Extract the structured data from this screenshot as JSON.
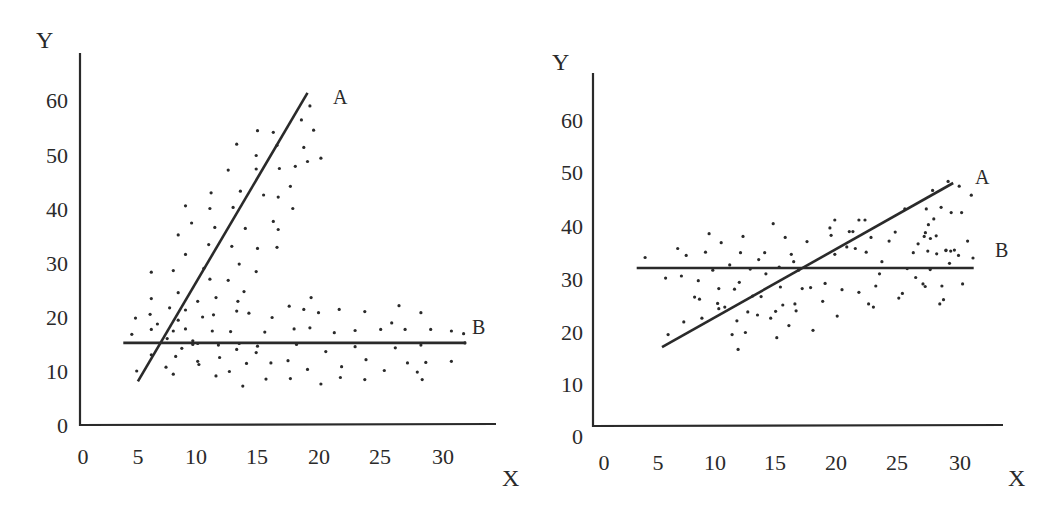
{
  "chart_data": [
    {
      "type": "scatter",
      "title": "",
      "xlabel": "X",
      "ylabel": "Y",
      "xlim": [
        0,
        34
      ],
      "ylim": [
        0,
        68
      ],
      "x_ticks": [
        "0",
        "5",
        "10",
        "15",
        "20",
        "25",
        "30"
      ],
      "y_ticks": [
        "0",
        "10",
        "20",
        "30",
        "40",
        "50",
        "60"
      ],
      "grid": false,
      "legend": "none",
      "lines": [
        {
          "name": "A",
          "x": [
            4.5,
            18.4
          ],
          "y": [
            8.1,
            61.5
          ]
        },
        {
          "name": "B",
          "x": [
            3.3,
            31.4
          ],
          "y": [
            15.2,
            15.2
          ]
        }
      ],
      "series": [
        {
          "name": "upper cluster",
          "points": [
            [
              18.6,
              59.1
            ],
            [
              17.9,
              56.5
            ],
            [
              18.9,
              54.6
            ],
            [
              15.6,
              54.2
            ],
            [
              15.9,
              51.8
            ],
            [
              14.3,
              54.5
            ],
            [
              12.6,
              52.0
            ],
            [
              14.2,
              49.9
            ],
            [
              18.1,
              51.4
            ],
            [
              19.5,
              49.4
            ],
            [
              17.4,
              47.9
            ],
            [
              18.4,
              48.8
            ],
            [
              16.1,
              47.5
            ],
            [
              14.2,
              47.4
            ],
            [
              11.9,
              47.2
            ],
            [
              14.8,
              42.6
            ],
            [
              12.9,
              43.3
            ],
            [
              16.0,
              42.2
            ],
            [
              17.0,
              44.2
            ],
            [
              10.5,
              43.0
            ],
            [
              8.4,
              40.6
            ],
            [
              10.4,
              40.1
            ],
            [
              12.3,
              40.3
            ],
            [
              17.2,
              40.1
            ],
            [
              8.9,
              37.4
            ],
            [
              10.8,
              36.6
            ],
            [
              13.3,
              36.4
            ],
            [
              15.6,
              37.7
            ],
            [
              16.0,
              36.2
            ],
            [
              7.8,
              35.2
            ],
            [
              10.3,
              33.4
            ],
            [
              12.2,
              33.1
            ],
            [
              14.3,
              32.7
            ],
            [
              15.9,
              32.9
            ],
            [
              8.4,
              31.6
            ],
            [
              9.9,
              29.0
            ],
            [
              12.8,
              29.8
            ],
            [
              14.2,
              28.4
            ],
            [
              5.6,
              28.3
            ],
            [
              7.4,
              28.6
            ],
            [
              10.4,
              27.0
            ],
            [
              11.9,
              26.8
            ],
            [
              7.8,
              24.5
            ],
            [
              13.2,
              24.7
            ],
            [
              5.6,
              23.4
            ],
            [
              10.9,
              23.6
            ],
            [
              12.7,
              22.9
            ],
            [
              9.4,
              22.9
            ],
            [
              8.4,
              21.3
            ],
            [
              13.6,
              20.7
            ],
            [
              12.6,
              21.1
            ],
            [
              10.7,
              20.4
            ],
            [
              9.8,
              20.0
            ]
          ]
        },
        {
          "name": "lower cluster",
          "points": [
            [
              4.3,
              19.8
            ],
            [
              5.5,
              20.5
            ],
            [
              6.1,
              18.7
            ],
            [
              5.6,
              17.7
            ],
            [
              7.4,
              17.4
            ],
            [
              7.8,
              19.4
            ],
            [
              8.4,
              17.8
            ],
            [
              7.1,
              21.7
            ],
            [
              4.0,
              16.8
            ],
            [
              6.9,
              16.0
            ],
            [
              9.0,
              15.6
            ],
            [
              9.4,
              15.1
            ],
            [
              10.6,
              17.4
            ],
            [
              11.1,
              14.8
            ],
            [
              12.1,
              17.3
            ],
            [
              14.3,
              14.6
            ],
            [
              14.9,
              17.2
            ],
            [
              15.5,
              19.9
            ],
            [
              16.9,
              22.0
            ],
            [
              17.3,
              17.8
            ],
            [
              18.1,
              21.4
            ],
            [
              18.7,
              23.6
            ],
            [
              18.6,
              18.0
            ],
            [
              19.3,
              20.8
            ],
            [
              20.6,
              17.1
            ],
            [
              21.0,
              21.4
            ],
            [
              22.3,
              17.5
            ],
            [
              23.1,
              21.0
            ],
            [
              24.4,
              17.7
            ],
            [
              25.3,
              18.9
            ],
            [
              25.9,
              22.1
            ],
            [
              26.4,
              17.7
            ],
            [
              27.7,
              20.8
            ],
            [
              28.5,
              17.7
            ],
            [
              30.2,
              17.4
            ],
            [
              31.2,
              16.9
            ],
            [
              31.3,
              15.2
            ],
            [
              4.4,
              10.0
            ],
            [
              5.6,
              13.0
            ],
            [
              6.8,
              10.7
            ],
            [
              7.4,
              9.4
            ],
            [
              7.6,
              12.7
            ],
            [
              8.1,
              14.2
            ],
            [
              9.0,
              14.9
            ],
            [
              9.4,
              11.8
            ],
            [
              9.5,
              11.2
            ],
            [
              10.9,
              9.1
            ],
            [
              11.2,
              12.5
            ],
            [
              12.0,
              9.9
            ],
            [
              12.6,
              14.0
            ],
            [
              13.4,
              11.4
            ],
            [
              14.2,
              13.4
            ],
            [
              15.0,
              8.5
            ],
            [
              15.4,
              11.5
            ],
            [
              16.8,
              11.9
            ],
            [
              17.0,
              8.6
            ],
            [
              17.5,
              14.9
            ],
            [
              18.4,
              10.3
            ],
            [
              19.5,
              7.6
            ],
            [
              19.9,
              13.6
            ],
            [
              21.1,
              8.8
            ],
            [
              21.2,
              10.8
            ],
            [
              22.3,
              14.5
            ],
            [
              23.2,
              12.1
            ],
            [
              23.1,
              8.4
            ],
            [
              24.7,
              10.1
            ],
            [
              25.6,
              14.3
            ],
            [
              26.6,
              11.5
            ],
            [
              27.4,
              9.8
            ],
            [
              27.7,
              14.8
            ],
            [
              27.8,
              8.4
            ],
            [
              28.1,
              11.6
            ],
            [
              30.2,
              11.8
            ],
            [
              13.1,
              7.2
            ],
            [
              12.8,
              15.1
            ]
          ]
        }
      ],
      "annotations": [
        {
          "text": "A",
          "near": "line A top end"
        },
        {
          "text": "B",
          "near": "line B right end"
        }
      ]
    },
    {
      "type": "scatter",
      "title": "",
      "xlabel": "X",
      "ylabel": "Y",
      "xlim": [
        0,
        34
      ],
      "ylim": [
        0,
        67
      ],
      "x_ticks": [
        "0",
        "5",
        "10",
        "15",
        "20",
        "25",
        "30"
      ],
      "y_ticks": [
        "0",
        "10",
        "20",
        "30",
        "40",
        "50",
        "60"
      ],
      "grid": false,
      "legend": "none",
      "lines": [
        {
          "name": "A",
          "x": [
            5.3,
            29.4
          ],
          "y": [
            17.0,
            48.1
          ]
        },
        {
          "name": "B",
          "x": [
            3.2,
            31.1
          ],
          "y": [
            32.0,
            32.0
          ]
        }
      ],
      "series": [
        {
          "name": "points",
          "points": [
            [
              3.9,
              34.0
            ],
            [
              5.6,
              30.1
            ],
            [
              5.8,
              19.4
            ],
            [
              6.6,
              35.7
            ],
            [
              6.9,
              30.5
            ],
            [
              7.1,
              21.8
            ],
            [
              7.3,
              34.4
            ],
            [
              8.0,
              26.5
            ],
            [
              8.3,
              29.6
            ],
            [
              8.4,
              26.1
            ],
            [
              8.6,
              22.5
            ],
            [
              8.9,
              35.0
            ],
            [
              9.2,
              38.5
            ],
            [
              9.5,
              31.6
            ],
            [
              9.9,
              25.3
            ],
            [
              10.0,
              28.1
            ],
            [
              10.0,
              24.3
            ],
            [
              10.2,
              36.8
            ],
            [
              10.5,
              24.6
            ],
            [
              10.9,
              32.6
            ],
            [
              11.1,
              19.4
            ],
            [
              11.3,
              28.0
            ],
            [
              11.5,
              22.0
            ],
            [
              11.6,
              16.6
            ],
            [
              11.7,
              29.3
            ],
            [
              11.8,
              34.9
            ],
            [
              12.0,
              38.0
            ],
            [
              12.2,
              19.8
            ],
            [
              12.4,
              23.7
            ],
            [
              12.6,
              31.8
            ],
            [
              12.8,
              26.7
            ],
            [
              13.2,
              23.1
            ],
            [
              13.3,
              33.6
            ],
            [
              13.5,
              26.6
            ],
            [
              13.8,
              34.9
            ],
            [
              13.9,
              30.9
            ],
            [
              14.3,
              22.5
            ],
            [
              14.5,
              40.4
            ],
            [
              14.7,
              23.8
            ],
            [
              14.8,
              18.8
            ],
            [
              15.0,
              32.2
            ],
            [
              15.1,
              28.4
            ],
            [
              15.3,
              25.0
            ],
            [
              15.5,
              37.8
            ],
            [
              15.8,
              21.1
            ],
            [
              16.0,
              34.6
            ],
            [
              16.2,
              33.2
            ],
            [
              16.3,
              25.2
            ],
            [
              16.4,
              23.9
            ],
            [
              16.6,
              31.6
            ],
            [
              16.9,
              28.1
            ],
            [
              17.3,
              37.0
            ],
            [
              17.6,
              28.3
            ],
            [
              17.8,
              20.2
            ],
            [
              18.6,
              25.7
            ],
            [
              18.8,
              29.1
            ],
            [
              19.2,
              39.6
            ],
            [
              19.3,
              38.2
            ],
            [
              19.6,
              41.1
            ],
            [
              19.6,
              34.6
            ],
            [
              19.8,
              22.9
            ],
            [
              20.2,
              27.9
            ],
            [
              20.6,
              36.0
            ],
            [
              20.8,
              38.9
            ],
            [
              21.1,
              38.9
            ],
            [
              21.3,
              35.7
            ],
            [
              21.6,
              27.4
            ],
            [
              21.6,
              41.1
            ],
            [
              22.1,
              41.1
            ],
            [
              22.2,
              35.0
            ],
            [
              22.4,
              25.2
            ],
            [
              22.6,
              37.8
            ],
            [
              22.8,
              24.6
            ],
            [
              23.0,
              28.6
            ],
            [
              23.3,
              30.9
            ],
            [
              23.5,
              33.2
            ],
            [
              24.1,
              37.1
            ],
            [
              24.6,
              38.8
            ],
            [
              24.9,
              26.3
            ],
            [
              25.2,
              27.2
            ],
            [
              25.4,
              43.2
            ],
            [
              25.6,
              31.9
            ],
            [
              26.1,
              34.9
            ],
            [
              26.3,
              30.2
            ],
            [
              26.5,
              36.6
            ],
            [
              26.9,
              29.0
            ],
            [
              27.1,
              38.7
            ],
            [
              27.3,
              35.2
            ],
            [
              27.5,
              31.7
            ],
            [
              27.7,
              46.7
            ],
            [
              27.8,
              41.3
            ],
            [
              28.0,
              38.1
            ],
            [
              28.4,
              43.5
            ],
            [
              28.6,
              26.0
            ],
            [
              28.8,
              35.3
            ],
            [
              29.1,
              32.9
            ],
            [
              29.2,
              35.2
            ],
            [
              29.5,
              35.4
            ],
            [
              29.9,
              47.5
            ],
            [
              30.1,
              42.5
            ],
            [
              30.6,
              37.1
            ],
            [
              30.9,
              45.8
            ],
            [
              31.4,
              38.0
            ],
            [
              31.5,
              28.5
            ],
            [
              31.6,
              43.2
            ],
            [
              31.8,
              40.2
            ],
            [
              32.0,
              37.6
            ],
            [
              32.6,
              34.7
            ],
            [
              32.9,
              25.2
            ],
            [
              33.1,
              28.6
            ],
            [
              33.5,
              35.4
            ],
            [
              33.7,
              48.4
            ],
            [
              34.0,
              42.5
            ],
            [
              34.7,
              34.4
            ],
            [
              35.1,
              29.0
            ],
            [
              36.1,
              33.9
            ]
          ]
        }
      ],
      "annotations": [
        {
          "text": "A",
          "near": "line A top end"
        },
        {
          "text": "B",
          "near": "line B right end"
        }
      ]
    }
  ],
  "charts": [
    {
      "y_axis_title": "Y",
      "x_axis_title": "X",
      "x_tick_labels": [
        "0",
        "5",
        "10",
        "15",
        "20",
        "25",
        "30"
      ],
      "y_tick_labels": [
        "60",
        "50",
        "40",
        "30",
        "20",
        "10",
        "0"
      ],
      "line_labels": {
        "a": "A",
        "b": "B"
      }
    },
    {
      "y_axis_title": "Y",
      "x_axis_title": "X",
      "x_tick_labels": [
        "0",
        "5",
        "10",
        "15",
        "20",
        "25",
        "30"
      ],
      "y_tick_labels": [
        "60",
        "50",
        "40",
        "30",
        "20",
        "10",
        "0"
      ],
      "line_labels": {
        "a": "A",
        "b": "B"
      }
    }
  ]
}
